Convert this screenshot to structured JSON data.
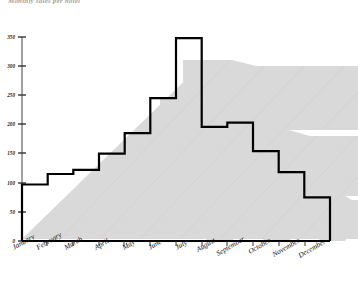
{
  "chart_title": "Monthly sales per hotel",
  "chart_data": {
    "type": "area",
    "title": "Monthly sales per hotel",
    "subtitle": "",
    "xlabel": "",
    "ylabel": "",
    "style": "3d-stepped-area",
    "grid": false,
    "legend": "none",
    "categories": [
      "January",
      "February",
      "March",
      "April",
      "May",
      "June",
      "July",
      "August",
      "September",
      "October",
      "November",
      "December"
    ],
    "values": [
      97,
      115,
      122,
      150,
      185,
      245,
      348,
      196,
      203,
      154,
      118,
      75
    ],
    "ylim": [
      0,
      350
    ],
    "yticks": [
      0,
      50,
      100,
      150,
      200,
      250,
      300,
      350
    ],
    "ytick_labels": [
      "0",
      "50",
      "100",
      "150",
      "200",
      "250",
      "300",
      "350"
    ],
    "xtick_labels": [
      "January",
      "February",
      "March",
      "April",
      "May",
      "June",
      "July",
      "August",
      "September",
      "October",
      "November",
      "December"
    ],
    "colors": {
      "line": "#000000",
      "depth_fill": "#d9d9d9",
      "depth_edge": "#cccccc",
      "plot_background": "#ffffff",
      "axis": "#000000",
      "tick_label": "#111111"
    }
  },
  "axes": {
    "y_axis_name": "value-axis",
    "x_axis_name": "category-axis",
    "y_tick_values": [
      "350",
      "300",
      "250",
      "200",
      "150",
      "100",
      "50",
      "0"
    ]
  }
}
